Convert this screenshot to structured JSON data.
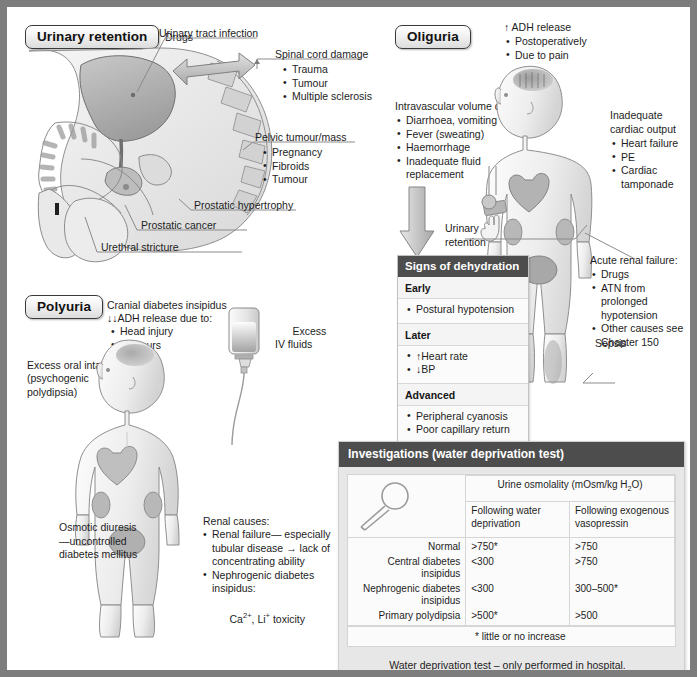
{
  "sections": {
    "urinary_retention": {
      "title": "Urinary retention",
      "labels": {
        "uti": "Urinary tract infection",
        "drugs": "Drugs",
        "spinal_cord": "Spinal cord damage",
        "spinal_items": [
          "Trauma",
          "Tumour",
          "Multiple sclerosis"
        ],
        "pelvic": "Pelvic tumour/mass",
        "pelvic_items": [
          "Pregnancy",
          "Fibroids",
          "Tumour"
        ],
        "prostatic_hypertrophy": "Prostatic hypertrophy",
        "prostatic_cancer": "Prostatic cancer",
        "urethral_stricture": "Urethral stricture"
      }
    },
    "polyuria": {
      "title": "Polyuria",
      "cranial_title": "Cranial diabetes insipidus",
      "cranial_sub": "↓↓ADH release due to:",
      "cranial_items": [
        "Head injury",
        "Tumours"
      ],
      "excess_iv": "Excess\nIV fluids",
      "excess_oral": "Excess oral intake",
      "excess_oral_sub": "(psychogenic\npolydipsia)",
      "osmotic": "Osmotic diuresis\n—uncontrolled\ndiabetes mellitus",
      "renal_title": "Renal causes:",
      "renal_items": [
        "Renal failure— especially tubular disease → lack of concentrating ability",
        "Nephrogenic diabetes insipidus:"
      ],
      "renal_ca_li": "Ca2+, Li+ toxicity"
    },
    "oliguria": {
      "title": "Oliguria",
      "adh_title": "↑ ADH release",
      "adh_items": [
        "Postoperatively",
        "Due to pain"
      ],
      "ivd_title": "Intravascular volume depletion",
      "ivd_items": [
        "Diarrhoea, vomiting",
        "Fever (sweating)",
        "Haemorrhage",
        "Inadequate fluid replacement"
      ],
      "cardiac_title": "Inadequate\ncardiac output",
      "cardiac_items": [
        "Heart failure",
        "PE",
        "Cardiac tamponade"
      ],
      "urinary_retention": "Urinary\nretention",
      "arf_title": "Acute renal failure:",
      "arf_items": [
        "Drugs",
        "ATN from prolonged hypotension",
        "Other causes see Chapter 150"
      ],
      "sepsis": "Sepsis"
    }
  },
  "dehydration": {
    "header": "Signs of dehydration",
    "groups": [
      {
        "title": "Early",
        "items": [
          "Postural hypotension"
        ]
      },
      {
        "title": "Later",
        "items": [
          "↑Heart rate",
          "↓BP"
        ]
      },
      {
        "title": "Advanced",
        "items": [
          "Peripheral cyanosis",
          "Poor capillary return"
        ]
      }
    ]
  },
  "investigations": {
    "header": "Investigations (water deprivation test)",
    "osmolality_header": "Urine osmolality (mOsm/kg H2O)",
    "col_headers": [
      "Following water deprivation",
      "Following exogenous vasopressin"
    ],
    "rows": [
      {
        "label": "Normal",
        "deprivation": ">750*",
        "vasopressin": ">750"
      },
      {
        "label": "Central diabetes insipidus",
        "deprivation": "<300",
        "vasopressin": ">750"
      },
      {
        "label": "Nephrogenic diabetes insipidus",
        "deprivation": "<300",
        "vasopressin": "300–500*"
      },
      {
        "label": "Primary polydipsia",
        "deprivation": ">500*",
        "vasopressin": ">500"
      }
    ],
    "footnote": "* little or no increase",
    "note_line1": "Water deprivation test – only performed in hospital.",
    "note_line2": "Patients denied fluids until 3–5% body weight is lost"
  },
  "colors": {
    "header_bar": "#4d4d4d",
    "border": "#7d7d7d",
    "organ_fill": "#b9b9b9",
    "body_fill": "#efefef",
    "page_bg": "#ffffff"
  }
}
